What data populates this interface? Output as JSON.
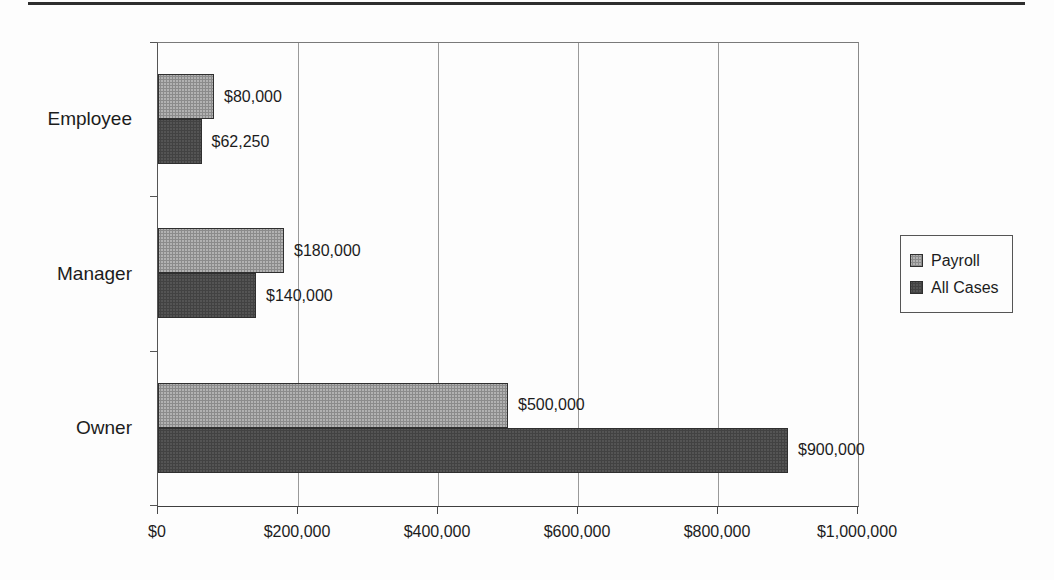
{
  "chart_data": {
    "type": "bar",
    "orientation": "horizontal",
    "categories": [
      "Employee",
      "Manager",
      "Owner"
    ],
    "series": [
      {
        "name": "Payroll",
        "color": "#b2b2b2",
        "values": [
          80000,
          180000,
          500000
        ],
        "labels": [
          "$80,000",
          "$180,000",
          "$500,000"
        ]
      },
      {
        "name": "All Cases",
        "color": "#545454",
        "values": [
          62250,
          140000,
          900000
        ],
        "labels": [
          "$62,250",
          "$140,000",
          "$900,000"
        ]
      }
    ],
    "xlim": [
      0,
      1000000
    ],
    "x_ticks": [
      0,
      200000,
      400000,
      600000,
      800000,
      1000000
    ],
    "x_tick_labels": [
      "$0",
      "$200,000",
      "$400,000",
      "$600,000",
      "$800,000",
      "$1,000,000"
    ],
    "grid": true,
    "legend_position": "right",
    "legend_entries": [
      "Payroll",
      "All Cases"
    ]
  }
}
